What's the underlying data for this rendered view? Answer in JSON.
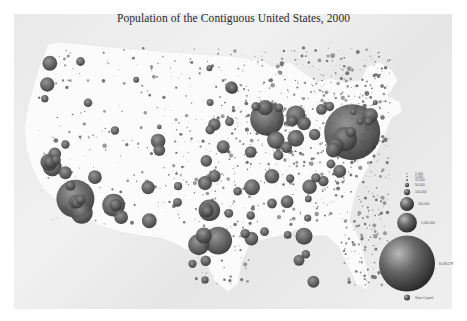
{
  "title": "Population of the Contiguous United States, 2000",
  "colors": {
    "background": "#ffffff",
    "panel": "#ebebeb",
    "land": "#fbfbfb",
    "bubble_light": "#a0a0a0",
    "bubble_mid": "#5e5e5e",
    "bubble_dark": "#2e2e2e",
    "text": "#2a2a2a"
  },
  "chart_data": {
    "type": "scatter",
    "subtype": "proportional-symbol map",
    "title": "Population of the Contiguous United States, 2000",
    "size_encoding": "city population",
    "legend": {
      "placement": "bottom-right",
      "entries": [
        {
          "label": "1,000",
          "value": 1000
        },
        {
          "label": "5,000",
          "value": 5000
        },
        {
          "label": "10,000",
          "value": 10000
        },
        {
          "label": "50,000",
          "value": 50000
        },
        {
          "label": "100,000",
          "value": 100000
        },
        {
          "label": "500,000",
          "value": 500000
        },
        {
          "label": "1,000,000",
          "value": 1000000
        },
        {
          "label": "8,008,278",
          "value": 8008278
        },
        {
          "label": "State Capital",
          "value": null
        }
      ]
    },
    "cities": [
      {
        "name": "New York",
        "lon": -74.0,
        "lat": 40.7,
        "pop": 8008278
      },
      {
        "name": "Los Angeles",
        "lon": -118.2,
        "lat": 34.1,
        "pop": 3694820
      },
      {
        "name": "Chicago",
        "lon": -87.6,
        "lat": 41.9,
        "pop": 2896016
      },
      {
        "name": "Houston",
        "lon": -95.4,
        "lat": 29.8,
        "pop": 1953631
      },
      {
        "name": "Philadelphia",
        "lon": -75.2,
        "lat": 40.0,
        "pop": 1517550
      },
      {
        "name": "Phoenix",
        "lon": -112.1,
        "lat": 33.4,
        "pop": 1321045
      },
      {
        "name": "San Diego",
        "lon": -117.2,
        "lat": 32.7,
        "pop": 1223400
      },
      {
        "name": "Dallas",
        "lon": -96.8,
        "lat": 32.8,
        "pop": 1188580
      },
      {
        "name": "San Antonio",
        "lon": -98.5,
        "lat": 29.4,
        "pop": 1144646
      },
      {
        "name": "Detroit",
        "lon": -83.0,
        "lat": 42.3,
        "pop": 951270
      },
      {
        "name": "San Jose",
        "lon": -121.9,
        "lat": 37.3,
        "pop": 894943
      },
      {
        "name": "Indianapolis",
        "lon": -86.2,
        "lat": 39.8,
        "pop": 781870
      },
      {
        "name": "San Francisco",
        "lon": -122.4,
        "lat": 37.8,
        "pop": 776733
      },
      {
        "name": "Jacksonville",
        "lon": -81.7,
        "lat": 30.3,
        "pop": 735617
      },
      {
        "name": "Columbus",
        "lon": -83.0,
        "lat": 40.0,
        "pop": 711470
      },
      {
        "name": "Austin",
        "lon": -97.7,
        "lat": 30.3,
        "pop": 656562
      },
      {
        "name": "Baltimore",
        "lon": -76.6,
        "lat": 39.3,
        "pop": 651154
      },
      {
        "name": "Memphis",
        "lon": -90.0,
        "lat": 35.1,
        "pop": 650100
      },
      {
        "name": "Milwaukee",
        "lon": -87.9,
        "lat": 43.0,
        "pop": 596974
      },
      {
        "name": "Boston",
        "lon": -71.1,
        "lat": 42.4,
        "pop": 589141
      },
      {
        "name": "Washington",
        "lon": -77.0,
        "lat": 38.9,
        "pop": 572059
      },
      {
        "name": "El Paso",
        "lon": -106.4,
        "lat": 31.8,
        "pop": 563662
      },
      {
        "name": "Seattle",
        "lon": -122.3,
        "lat": 47.6,
        "pop": 563374
      },
      {
        "name": "Denver",
        "lon": -105.0,
        "lat": 39.7,
        "pop": 554636
      },
      {
        "name": "Nashville",
        "lon": -86.8,
        "lat": 36.2,
        "pop": 545524
      },
      {
        "name": "Charlotte",
        "lon": -80.8,
        "lat": 35.2,
        "pop": 540828
      },
      {
        "name": "Fort Worth",
        "lon": -97.3,
        "lat": 32.8,
        "pop": 534694
      },
      {
        "name": "Portland",
        "lon": -122.7,
        "lat": 45.5,
        "pop": 529121
      },
      {
        "name": "Oklahoma City",
        "lon": -97.5,
        "lat": 35.5,
        "pop": 506132
      },
      {
        "name": "Tucson",
        "lon": -110.9,
        "lat": 32.2,
        "pop": 486699
      },
      {
        "name": "New Orleans",
        "lon": -90.1,
        "lat": 30.0,
        "pop": 484674
      },
      {
        "name": "Las Vegas",
        "lon": -115.1,
        "lat": 36.2,
        "pop": 478434
      },
      {
        "name": "Cleveland",
        "lon": -81.7,
        "lat": 41.5,
        "pop": 478403
      },
      {
        "name": "Long Beach",
        "lon": -118.2,
        "lat": 33.8,
        "pop": 461522
      },
      {
        "name": "Albuquerque",
        "lon": -106.6,
        "lat": 35.1,
        "pop": 448607
      },
      {
        "name": "Kansas City",
        "lon": -94.6,
        "lat": 39.1,
        "pop": 441545
      },
      {
        "name": "Fresno",
        "lon": -119.8,
        "lat": 36.7,
        "pop": 427652
      },
      {
        "name": "Virginia Beach",
        "lon": -76.0,
        "lat": 36.8,
        "pop": 425257
      },
      {
        "name": "Atlanta",
        "lon": -84.4,
        "lat": 33.7,
        "pop": 416474
      },
      {
        "name": "Sacramento",
        "lon": -121.5,
        "lat": 38.6,
        "pop": 407018
      },
      {
        "name": "Oakland",
        "lon": -122.3,
        "lat": 37.8,
        "pop": 399484
      },
      {
        "name": "Mesa",
        "lon": -111.8,
        "lat": 33.4,
        "pop": 396375
      },
      {
        "name": "Tulsa",
        "lon": -96.0,
        "lat": 36.2,
        "pop": 393049
      },
      {
        "name": "Omaha",
        "lon": -96.0,
        "lat": 41.3,
        "pop": 390007
      },
      {
        "name": "Minneapolis",
        "lon": -93.3,
        "lat": 45.0,
        "pop": 382618
      },
      {
        "name": "Honolulu-excluded",
        "lon": null,
        "lat": null,
        "pop": null
      },
      {
        "name": "Miami",
        "lon": -80.2,
        "lat": 25.8,
        "pop": 362470
      },
      {
        "name": "Colorado Springs",
        "lon": -104.8,
        "lat": 38.8,
        "pop": 360890
      },
      {
        "name": "St. Louis",
        "lon": -90.2,
        "lat": 38.6,
        "pop": 348189
      },
      {
        "name": "Wichita",
        "lon": -97.3,
        "lat": 37.7,
        "pop": 344284
      },
      {
        "name": "Santa Ana",
        "lon": -117.9,
        "lat": 33.7,
        "pop": 337977
      },
      {
        "name": "Pittsburgh",
        "lon": -80.0,
        "lat": 40.4,
        "pop": 334563
      },
      {
        "name": "Arlington TX",
        "lon": -97.1,
        "lat": 32.7,
        "pop": 332969
      },
      {
        "name": "Cincinnati",
        "lon": -84.5,
        "lat": 39.1,
        "pop": 331285
      },
      {
        "name": "Toledo",
        "lon": -83.6,
        "lat": 41.7,
        "pop": 313619
      },
      {
        "name": "Tampa",
        "lon": -82.5,
        "lat": 27.9,
        "pop": 303447
      },
      {
        "name": "Buffalo",
        "lon": -78.9,
        "lat": 42.9,
        "pop": 292648
      },
      {
        "name": "St. Paul",
        "lon": -93.1,
        "lat": 44.9,
        "pop": 287151
      },
      {
        "name": "Corpus Christi",
        "lon": -97.4,
        "lat": 27.8,
        "pop": 277454
      },
      {
        "name": "Raleigh",
        "lon": -78.6,
        "lat": 35.8,
        "pop": 276093
      },
      {
        "name": "Newark",
        "lon": -74.2,
        "lat": 40.7,
        "pop": 273546
      },
      {
        "name": "Louisville",
        "lon": -85.8,
        "lat": 38.3,
        "pop": 256231
      },
      {
        "name": "Lincoln",
        "lon": -96.7,
        "lat": 40.8,
        "pop": 225581
      },
      {
        "name": "Salt Lake City",
        "lon": -111.9,
        "lat": 40.8,
        "pop": 181743
      },
      {
        "name": "Boise",
        "lon": -116.2,
        "lat": 43.6,
        "pop": 185787
      },
      {
        "name": "Spokane",
        "lon": -117.4,
        "lat": 47.7,
        "pop": 195629
      },
      {
        "name": "Birmingham",
        "lon": -86.8,
        "lat": 33.5,
        "pop": 242820
      },
      {
        "name": "Orlando",
        "lon": -81.4,
        "lat": 28.5,
        "pop": 185951
      },
      {
        "name": "Richmond",
        "lon": -77.4,
        "lat": 37.5,
        "pop": 197790
      },
      {
        "name": "Des Moines",
        "lon": -93.6,
        "lat": 41.6,
        "pop": 198682
      },
      {
        "name": "Little Rock",
        "lon": -92.3,
        "lat": 34.7,
        "pop": 183133
      },
      {
        "name": "Baton Rouge",
        "lon": -91.1,
        "lat": 30.5,
        "pop": 227818
      },
      {
        "name": "Shreveport",
        "lon": -93.7,
        "lat": 32.5,
        "pop": 200145
      },
      {
        "name": "Lubbock",
        "lon": -101.9,
        "lat": 33.6,
        "pop": 199564
      },
      {
        "name": "Amarillo",
        "lon": -101.8,
        "lat": 35.2,
        "pop": 173627
      },
      {
        "name": "Reno",
        "lon": -119.8,
        "lat": 39.5,
        "pop": 180480
      },
      {
        "name": "Madison",
        "lon": -89.4,
        "lat": 43.1,
        "pop": 208054
      },
      {
        "name": "Grand Rapids",
        "lon": -85.7,
        "lat": 43.0,
        "pop": 197800
      },
      {
        "name": "Rochester",
        "lon": -77.6,
        "lat": 43.2,
        "pop": 219773
      },
      {
        "name": "Providence",
        "lon": -71.4,
        "lat": 41.8,
        "pop": 173618
      },
      {
        "name": "Hartford",
        "lon": -72.7,
        "lat": 41.8,
        "pop": 121578
      },
      {
        "name": "Billings",
        "lon": -108.5,
        "lat": 45.8,
        "pop": 89847
      },
      {
        "name": "Fargo",
        "lon": -96.8,
        "lat": 46.9,
        "pop": 90599
      },
      {
        "name": "Sioux Falls",
        "lon": -96.7,
        "lat": 43.5,
        "pop": 123975
      },
      {
        "name": "Cheyenne",
        "lon": -104.8,
        "lat": 41.1,
        "pop": 53011
      },
      {
        "name": "Eugene",
        "lon": -123.1,
        "lat": 44.1,
        "pop": 137893
      },
      {
        "name": "Jackson",
        "lon": -90.2,
        "lat": 32.3,
        "pop": 184256
      },
      {
        "name": "Mobile",
        "lon": -88.0,
        "lat": 30.7,
        "pop": 198915
      },
      {
        "name": "Knoxville",
        "lon": -83.9,
        "lat": 36.0,
        "pop": 173890
      },
      {
        "name": "Greensboro",
        "lon": -79.8,
        "lat": 36.1,
        "pop": 223891
      },
      {
        "name": "Columbia",
        "lon": -81.0,
        "lat": 34.0,
        "pop": 116278
      },
      {
        "name": "Savannah",
        "lon": -81.1,
        "lat": 32.1,
        "pop": 131510
      },
      {
        "name": "Tallahassee",
        "lon": -84.3,
        "lat": 30.4,
        "pop": 150624
      },
      {
        "name": "Albany",
        "lon": -73.8,
        "lat": 42.7,
        "pop": 95658
      },
      {
        "name": "Portland ME",
        "lon": -70.3,
        "lat": 43.7,
        "pop": 64249
      },
      {
        "name": "Bakersfield",
        "lon": -119.0,
        "lat": 35.4,
        "pop": 247057
      },
      {
        "name": "Stockton",
        "lon": -121.3,
        "lat": 38.0,
        "pop": 243771
      },
      {
        "name": "Riverside",
        "lon": -117.4,
        "lat": 34.0,
        "pop": 255166
      },
      {
        "name": "Laredo",
        "lon": -99.5,
        "lat": 27.5,
        "pop": 176576
      },
      {
        "name": "Brownsville",
        "lon": -97.5,
        "lat": 25.9,
        "pop": 139722
      }
    ]
  }
}
